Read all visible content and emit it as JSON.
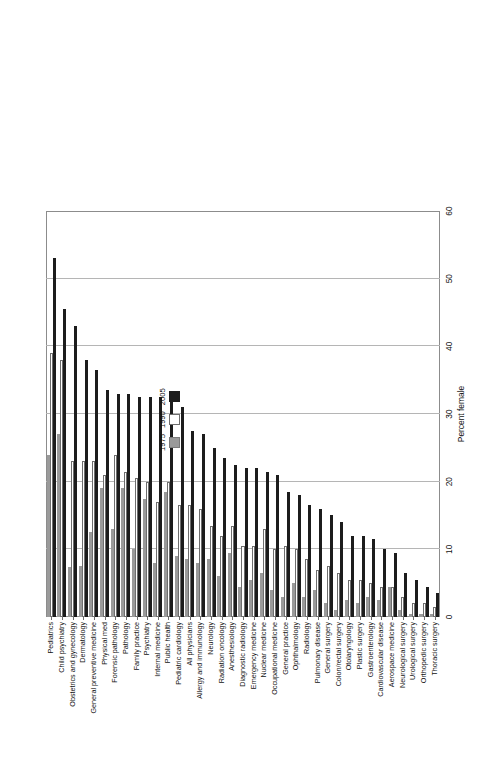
{
  "chart_data": {
    "type": "bar",
    "orientation": "horizontal",
    "title": "",
    "xlabel": "",
    "ylabel": "Percent female",
    "value_axis_title": "Percent female",
    "ylim": [
      0,
      60
    ],
    "axis_ticks": [
      0,
      10,
      20,
      30,
      40,
      50,
      60
    ],
    "grid": true,
    "legend_position": "inside-right",
    "categories": [
      "Pediatrics",
      "Child psychiatry",
      "Obstetrics and gynecology",
      "Dermatology",
      "General preventive medicine",
      "Physical med",
      "Forensic pathology",
      "Pathology",
      "Family practice",
      "Psychiatry",
      "Internal medicine",
      "Public health",
      "Pediatric cardiology",
      "All physicians",
      "Allergy and immunology",
      "Neurology",
      "Radiation oncology",
      "Anesthesiology",
      "Diagnostic radiology",
      "Emergency medicine",
      "Nuclear medicine",
      "Occupational medicine",
      "General practice",
      "Ophthalmology",
      "Radiology",
      "Pulmonary disease",
      "General surgery",
      "Colon/rectal surgery",
      "Otolaryngology",
      "Plastic surgery",
      "Gastroenterology",
      "Cardiovascular disease",
      "Aerospace medicine",
      "Neurological surgery",
      "Urological surgery",
      "Orthopedic surgery",
      "Thoracic surgery"
    ],
    "series": [
      {
        "name": "1975",
        "color": "#9a9a9a",
        "values": [
          24.0,
          27.0,
          7.4,
          7.5,
          12.5,
          19.0,
          13.0,
          19.0,
          10.0,
          17.5,
          8.0,
          18.5,
          9.0,
          8.5,
          8.0,
          8.5,
          6.0,
          9.5,
          4.5,
          5.5,
          6.5,
          4.0,
          3.0,
          5.0,
          3.0,
          4.0,
          2.0,
          1.0,
          2.5,
          2.0,
          3.0,
          2.5,
          4.5,
          1.0,
          0.5,
          0.5,
          0.5
        ]
      },
      {
        "name": "1990",
        "color": "#ffffff",
        "values": [
          39.0,
          38.0,
          23.0,
          23.0,
          23.0,
          21.0,
          24.0,
          21.5,
          20.5,
          20.0,
          17.0,
          20.0,
          16.5,
          16.5,
          16.0,
          13.5,
          12.0,
          13.5,
          10.5,
          10.5,
          13.0,
          10.0,
          10.5,
          10.0,
          8.5,
          7.0,
          7.5,
          6.5,
          5.5,
          5.5,
          5.0,
          4.5,
          4.5,
          3.0,
          2.0,
          2.0,
          1.5
        ]
      },
      {
        "name": "2005",
        "color": "#1c1c1c",
        "values": [
          53.0,
          45.5,
          43.0,
          38.0,
          36.5,
          33.5,
          33.0,
          33.0,
          32.5,
          32.5,
          32.5,
          32.0,
          31.0,
          27.5,
          27.0,
          25.0,
          23.5,
          22.5,
          22.0,
          22.0,
          21.5,
          21.0,
          18.5,
          18.0,
          16.5,
          16.0,
          15.0,
          14.0,
          12.0,
          12.0,
          11.5,
          10.0,
          9.5,
          6.5,
          5.5,
          4.5,
          3.5
        ]
      }
    ]
  },
  "legend": {
    "items": [
      {
        "label": "1975",
        "swatch": "gray-swatch"
      },
      {
        "label": "1990",
        "swatch": "white-swatch"
      },
      {
        "label": "2005",
        "swatch": "black-swatch"
      }
    ]
  },
  "axis": {
    "value_title": "Percent female",
    "ticks": [
      "0",
      "10",
      "20",
      "30",
      "40",
      "50",
      "60"
    ]
  }
}
